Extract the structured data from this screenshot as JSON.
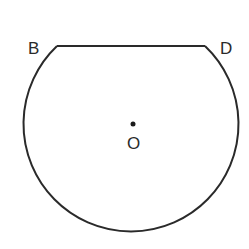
{
  "diagram": {
    "type": "circle-segment",
    "circle": {
      "cx": 131,
      "cy": 124,
      "r": 107.5
    },
    "chord": {
      "y": 46,
      "x1": 57,
      "x2": 205
    },
    "stroke_color": "#2a2a2a",
    "center_point": {
      "x": 133,
      "y": 124
    },
    "labels": {
      "B": "B",
      "D": "D",
      "O": "O"
    }
  }
}
